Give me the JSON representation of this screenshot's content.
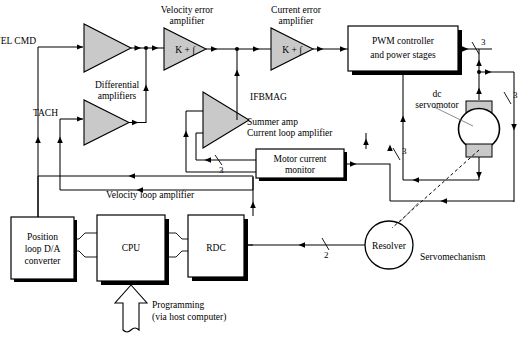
{
  "figure": {
    "accent_fill": "#c9c9c9",
    "line_color": "#000000"
  },
  "signals": {
    "vel_cmd": "VEL CMD",
    "tach": "TACH",
    "ifbmag": "IFBMAG"
  },
  "amplifiers": {
    "differential_label": "Differential\namplifiers",
    "differential_line1": "Differential",
    "differential_line2": "amplifiers",
    "velocity_error_line1": "Velocity error",
    "velocity_error_line2": "amplifier",
    "current_error_line1": "Current error",
    "current_error_line2": "amplifier",
    "velocity_error_symbol": "K + ∫",
    "current_error_symbol": "K + ∫",
    "summer_line1": "Summer amp",
    "summer_line2": "Current loop amplifier",
    "velocity_loop": "Velocity loop amplifier"
  },
  "blocks": {
    "pwm_line1": "PWM controller",
    "pwm_line2": "and power stages",
    "motor_current_line1": "Motor current",
    "motor_current_line2": "monitor",
    "dac_line1": "Position",
    "dac_line2": "loop D/A",
    "dac_line3": "converter",
    "cpu": "CPU",
    "rdc": "RDC"
  },
  "devices": {
    "dc_servomotor_line1": "dc",
    "dc_servomotor_line2": "servomotor",
    "resolver": "Resolver",
    "servomechanism": "Servomechanism"
  },
  "bus_widths": {
    "pwm_out": "3",
    "motor_right": "3",
    "motor_current_in": "3",
    "pwm_feedback": "3",
    "resolver_out": "2"
  },
  "programming": {
    "line1": "Programming",
    "line2": "(via host computer)"
  }
}
